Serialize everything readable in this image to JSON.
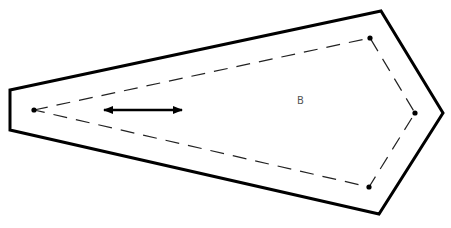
{
  "diagram": {
    "outer_boundary": {
      "points": "10,90 381,11 443,113 379,214 10,130",
      "stroke": "#000000",
      "stroke_width": 3
    },
    "inner_path": {
      "points": "34,110 370,38 415,113 369,187 34,110",
      "stroke": "#222222",
      "stroke_width": 1.2,
      "dash": "14,9"
    },
    "vertices": [
      {
        "x": 34,
        "y": 110
      },
      {
        "x": 370,
        "y": 38
      },
      {
        "x": 415,
        "y": 113
      },
      {
        "x": 369,
        "y": 187
      }
    ],
    "arrow": {
      "x1": 104,
      "y1": 110,
      "x2": 182,
      "y2": 110,
      "type": "double-headed"
    },
    "label": {
      "text": "B",
      "x": 297,
      "y": 96
    }
  }
}
